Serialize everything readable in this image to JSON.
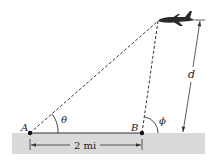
{
  "diagram": {
    "points": {
      "A": {
        "label": "A"
      },
      "B": {
        "label": "B"
      }
    },
    "angles": {
      "theta": {
        "label": "θ"
      },
      "phi": {
        "label": "ϕ"
      }
    },
    "dimensions": {
      "base": {
        "label": "2 mi"
      },
      "height": {
        "label": "d"
      }
    },
    "colors": {
      "ground": "#d9d9d9",
      "lines": "#333333",
      "plane": "#2a2a2a"
    }
  }
}
